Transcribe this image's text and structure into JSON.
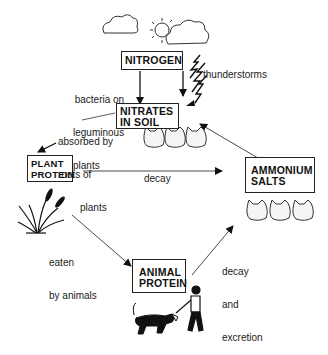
{
  "diagram": {
    "nodes": {
      "nitrogen": "NITROGEN",
      "nitrates_1": "NITRATES",
      "nitrates_2": "IN SOIL",
      "plant_1": "PLANT",
      "plant_2": "PROTEIN",
      "ammonium_1": "AMMONIUM",
      "ammonium_2": "SALTS",
      "animal_1": "ANIMAL",
      "animal_2": "PROTEIN"
    },
    "edges": {
      "bacteria_1": "bacteria on",
      "bacteria_2": "leguminous",
      "bacteria_3": "plants",
      "thunder": "thunderstorms",
      "absorbed_1": "absorbed by",
      "absorbed_2": "roots of",
      "absorbed_3": "plants",
      "decay": "decay",
      "eaten_1": "eaten",
      "eaten_2": "by animals",
      "decay_exc_1": "decay",
      "decay_exc_2": "and",
      "decay_exc_3": "excretion"
    },
    "icons": [
      "cloud-icon",
      "sun-icon",
      "lightning-icon",
      "soil-bag-icon",
      "plant-icon",
      "dog-icon",
      "person-icon"
    ]
  }
}
